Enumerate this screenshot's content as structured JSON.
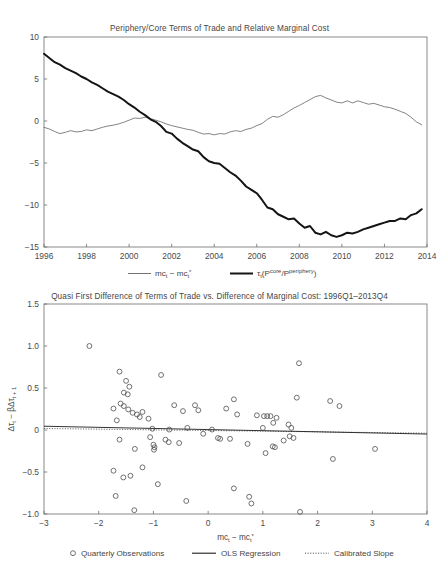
{
  "figure": {
    "width": 439,
    "height": 579,
    "background": "#ffffff"
  },
  "top_panel": {
    "title": "Periphery/Core Terms of Trade and Relative Marginal Cost",
    "legend": [
      {
        "label": "mc",
        "sub": "t",
        "label2": " − mc",
        "sub2": "t",
        "sup2": "*",
        "style": "thin-line",
        "name": "legend-mc-diff"
      },
      {
        "label": "τ",
        "sub": "t",
        "label2": "(P",
        "sup2": "core",
        "label3": "/P",
        "sup3": "periphery",
        "label4": ")",
        "style": "thick-line",
        "name": "legend-tau"
      }
    ]
  },
  "bottom_panel": {
    "title": "Quasi First Difference of Terms of Trade vs. Difference of Marginal Cost: 1996Q1–2013Q4",
    "legend": [
      {
        "label": "Quarterly Observations",
        "style": "circle-marker",
        "name": "legend-quarterly-observations"
      },
      {
        "label": "OLS Regression",
        "style": "solid-line",
        "name": "legend-ols-regression"
      },
      {
        "label": "Calibrated Slope",
        "style": "dotted-line",
        "name": "legend-calibrated-slope"
      }
    ]
  },
  "chart_data": [
    {
      "type": "line",
      "name": "top-timeseries",
      "title": "Periphery/Core Terms of Trade and Relative Marginal Cost",
      "xlabel": "",
      "ylabel": "",
      "xlim": [
        1996.0,
        2014.0
      ],
      "ylim": [
        -15,
        10
      ],
      "xticks": [
        1996,
        1998,
        2000,
        2002,
        2004,
        2006,
        2008,
        2010,
        2012,
        2014
      ],
      "xticklabels": [
        "1996",
        "1998",
        "2000",
        "2002",
        "2004",
        "2006",
        "2008",
        "2010",
        "2012",
        "2014"
      ],
      "yticks": [
        10,
        5,
        0,
        -5,
        -10,
        -15
      ],
      "yticklabels": [
        "10",
        "5",
        "0",
        "-5",
        "-10",
        "-15"
      ],
      "grid": false,
      "legend_position": "below-axes",
      "series": [
        {
          "name": "mc_t - mc_t*",
          "style": "thin",
          "color": "#5a5a5a",
          "x": [
            1996.0,
            1996.25,
            1996.5,
            1996.75,
            1997.0,
            1997.25,
            1997.5,
            1997.75,
            1998.0,
            1998.25,
            1998.5,
            1998.75,
            1999.0,
            1999.25,
            1999.5,
            1999.75,
            2000.0,
            2000.25,
            2000.5,
            2000.75,
            2001.0,
            2001.25,
            2001.5,
            2001.75,
            2002.0,
            2002.25,
            2002.5,
            2002.75,
            2003.0,
            2003.25,
            2003.5,
            2003.75,
            2004.0,
            2004.25,
            2004.5,
            2004.75,
            2005.0,
            2005.25,
            2005.5,
            2005.75,
            2006.0,
            2006.25,
            2006.5,
            2006.75,
            2007.0,
            2007.25,
            2007.5,
            2007.75,
            2008.0,
            2008.25,
            2008.5,
            2008.75,
            2009.0,
            2009.25,
            2009.5,
            2009.75,
            2010.0,
            2010.25,
            2010.5,
            2010.75,
            2011.0,
            2011.25,
            2011.5,
            2011.75,
            2012.0,
            2012.25,
            2012.5,
            2012.75,
            2013.0,
            2013.25,
            2013.5,
            2013.75
          ],
          "values": [
            -0.75,
            -0.95,
            -1.25,
            -1.5,
            -1.35,
            -1.15,
            -1.3,
            -1.25,
            -1.05,
            -1.15,
            -0.95,
            -0.75,
            -0.6,
            -0.5,
            -0.35,
            -0.15,
            0.1,
            0.35,
            0.3,
            0.45,
            0.3,
            0.1,
            -0.1,
            -0.35,
            -0.55,
            -0.7,
            -0.85,
            -1.0,
            -1.1,
            -1.35,
            -1.55,
            -1.5,
            -1.65,
            -1.5,
            -1.55,
            -1.3,
            -1.15,
            -1.25,
            -1.0,
            -0.85,
            -0.55,
            -0.3,
            0.2,
            0.55,
            0.45,
            0.75,
            1.15,
            1.55,
            1.85,
            2.2,
            2.55,
            2.9,
            3.05,
            2.75,
            2.5,
            2.25,
            2.15,
            2.4,
            2.15,
            2.4,
            2.2,
            2.0,
            2.1,
            1.9,
            1.7,
            1.6,
            1.4,
            1.15,
            0.9,
            0.45,
            -0.1,
            -0.45
          ]
        },
        {
          "name": "tau_t(P_core/P_periphery)",
          "style": "thick",
          "color": "#141414",
          "x": [
            1996.0,
            1996.25,
            1996.5,
            1996.75,
            1997.0,
            1997.25,
            1997.5,
            1997.75,
            1998.0,
            1998.25,
            1998.5,
            1998.75,
            1999.0,
            1999.25,
            1999.5,
            1999.75,
            2000.0,
            2000.25,
            2000.5,
            2000.75,
            2001.0,
            2001.25,
            2001.5,
            2001.75,
            2002.0,
            2002.25,
            2002.5,
            2002.75,
            2003.0,
            2003.25,
            2003.5,
            2003.75,
            2004.0,
            2004.25,
            2004.5,
            2004.75,
            2005.0,
            2005.25,
            2005.5,
            2005.75,
            2006.0,
            2006.25,
            2006.5,
            2006.75,
            2007.0,
            2007.25,
            2007.5,
            2007.75,
            2008.0,
            2008.25,
            2008.5,
            2008.75,
            2009.0,
            2009.25,
            2009.5,
            2009.75,
            2010.0,
            2010.25,
            2010.5,
            2010.75,
            2011.0,
            2011.25,
            2011.5,
            2011.75,
            2012.0,
            2012.25,
            2012.5,
            2012.75,
            2013.0,
            2013.25,
            2013.5,
            2013.75
          ],
          "values": [
            8.0,
            7.5,
            7.0,
            6.7,
            6.3,
            6.0,
            5.7,
            5.3,
            5.0,
            4.6,
            4.3,
            3.9,
            3.5,
            3.2,
            2.9,
            2.5,
            2.0,
            1.6,
            1.1,
            0.7,
            0.2,
            -0.1,
            -0.6,
            -1.3,
            -1.5,
            -2.1,
            -2.6,
            -3.0,
            -3.4,
            -3.6,
            -4.3,
            -4.8,
            -5.0,
            -5.1,
            -5.6,
            -6.1,
            -6.5,
            -7.1,
            -7.8,
            -8.2,
            -8.6,
            -9.4,
            -10.3,
            -10.5,
            -11.1,
            -11.4,
            -11.7,
            -11.6,
            -12.2,
            -12.7,
            -12.5,
            -13.3,
            -13.5,
            -13.2,
            -13.6,
            -13.8,
            -13.6,
            -13.3,
            -13.4,
            -13.2,
            -12.9,
            -12.7,
            -12.5,
            -12.3,
            -12.1,
            -11.9,
            -11.9,
            -11.6,
            -11.7,
            -11.2,
            -11.0,
            -10.5
          ]
        }
      ]
    },
    {
      "type": "scatter",
      "name": "bottom-scatter",
      "title": "Quasi First Difference of Terms of Trade vs. Difference of Marginal Cost: 1996Q1–2013Q4",
      "xlabel": "mc_t − mc_t*",
      "ylabel": "Δτ_t − βΔτ_(t+1)",
      "xlim": [
        -3,
        4
      ],
      "ylim": [
        -1.0,
        1.5
      ],
      "xticks": [
        -3,
        -2,
        -1,
        0,
        1,
        2,
        3,
        4
      ],
      "xticklabels": [
        "-3",
        "-2",
        "-1",
        "0",
        "1",
        "2",
        "3",
        "4"
      ],
      "yticks": [
        1.5,
        1.0,
        0.5,
        0,
        -0.5,
        -1.0
      ],
      "yticklabels": [
        "1.5",
        "1.0",
        "0.5",
        "0",
        "-0.5",
        "-1.0"
      ],
      "grid": false,
      "marker": "open-circle",
      "legend_position": "below-axes",
      "points": [
        [
          -2.17,
          1.0
        ],
        [
          -1.62,
          0.695
        ],
        [
          -1.5,
          0.585
        ],
        [
          -1.44,
          0.515
        ],
        [
          -1.54,
          0.445
        ],
        [
          -1.47,
          0.425
        ],
        [
          -1.6,
          0.315
        ],
        [
          -1.54,
          0.285
        ],
        [
          -1.73,
          0.255
        ],
        [
          -1.46,
          0.245
        ],
        [
          -1.38,
          0.205
        ],
        [
          -1.3,
          0.185
        ],
        [
          -1.2,
          0.215
        ],
        [
          -1.25,
          0.155
        ],
        [
          -1.67,
          0.115
        ],
        [
          -1.09,
          0.135
        ],
        [
          -0.86,
          0.655
        ],
        [
          -0.62,
          0.295
        ],
        [
          -0.46,
          0.225
        ],
        [
          -0.24,
          0.295
        ],
        [
          -0.18,
          0.235
        ],
        [
          -1.02,
          0.015
        ],
        [
          -0.71,
          0.005
        ],
        [
          -0.38,
          0.025
        ],
        [
          -0.09,
          -0.045
        ],
        [
          0.07,
          0.005
        ],
        [
          -1.62,
          -0.115
        ],
        [
          -1.34,
          -0.225
        ],
        [
          -1.06,
          -0.085
        ],
        [
          -1.0,
          -0.175
        ],
        [
          -0.98,
          -0.205
        ],
        [
          -0.99,
          -0.235
        ],
        [
          -0.78,
          -0.115
        ],
        [
          -0.72,
          -0.145
        ],
        [
          -0.53,
          -0.155
        ],
        [
          -1.73,
          -0.485
        ],
        [
          -1.55,
          -0.565
        ],
        [
          -1.42,
          -0.545
        ],
        [
          -1.2,
          -0.445
        ],
        [
          -0.92,
          -0.645
        ],
        [
          -1.69,
          -0.785
        ],
        [
          -1.35,
          -0.955
        ],
        [
          -0.4,
          -0.845
        ],
        [
          0.18,
          -0.095
        ],
        [
          0.33,
          0.255
        ],
        [
          0.47,
          0.365
        ],
        [
          0.53,
          0.185
        ],
        [
          0.89,
          0.175
        ],
        [
          1.02,
          0.165
        ],
        [
          1.08,
          0.165
        ],
        [
          1.14,
          0.165
        ],
        [
          1.25,
          0.145
        ],
        [
          1.19,
          0.085
        ],
        [
          1.0,
          0.025
        ],
        [
          1.62,
          0.385
        ],
        [
          1.47,
          0.065
        ],
        [
          1.52,
          0.025
        ],
        [
          0.22,
          -0.105
        ],
        [
          0.4,
          -0.105
        ],
        [
          0.72,
          -0.165
        ],
        [
          1.18,
          -0.195
        ],
        [
          1.22,
          -0.205
        ],
        [
          1.38,
          -0.125
        ],
        [
          1.49,
          -0.075
        ],
        [
          1.56,
          -0.095
        ],
        [
          1.05,
          -0.275
        ],
        [
          0.47,
          -0.695
        ],
        [
          0.75,
          -0.795
        ],
        [
          0.79,
          -0.875
        ],
        [
          1.68,
          -0.975
        ],
        [
          1.66,
          0.795
        ],
        [
          2.23,
          0.345
        ],
        [
          2.4,
          0.285
        ],
        [
          2.28,
          -0.345
        ],
        [
          3.05,
          -0.225
        ]
      ],
      "ols_regression": {
        "x": [
          -3,
          4
        ],
        "y": [
          0.045,
          -0.048
        ],
        "slope": -0.0133,
        "intercept": 0.0053
      },
      "calibrated_slope": {
        "x": [
          -3,
          4
        ],
        "y": [
          0.018,
          -0.038
        ],
        "slope": -0.008,
        "intercept": -0.006
      }
    }
  ]
}
